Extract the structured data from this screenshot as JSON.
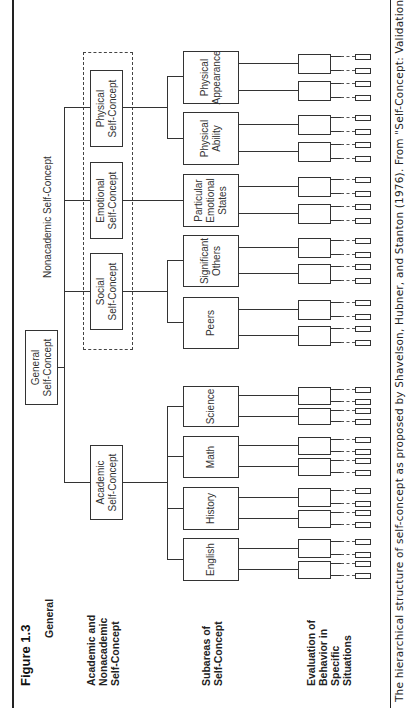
{
  "figure": {
    "title": "Figure 1.3",
    "caption": "The hierarchical structure of self-concept as proposed by Shavelson, Hubner, and Stanton (1976). From \"Self-Concept: Validation of Construct Interpretations\""
  },
  "level_labels": {
    "general": "General",
    "academic_nonacademic": [
      "Academic and",
      "Nonacademic",
      "Self-Concept"
    ],
    "subareas": [
      "Subareas of",
      "Self-Concept"
    ],
    "evaluation": [
      "Evaluation of",
      "Behavior in",
      "Specific",
      "Situations"
    ]
  },
  "nodes": {
    "general": [
      "General",
      "Self-Concept"
    ],
    "academic": [
      "Academic",
      "Self-Concept"
    ],
    "nonacademic_label": "Nonacademic Self-Concept",
    "social": [
      "Social",
      "Self-Concept"
    ],
    "emotional": [
      "Emotional",
      "Self-Concept"
    ],
    "physical": [
      "Physical",
      "Self-Concept"
    ]
  },
  "subareas": [
    {
      "label": "English"
    },
    {
      "label": "History"
    },
    {
      "label": "Math"
    },
    {
      "label": "Science"
    },
    {
      "label": "Peers"
    },
    {
      "label": "Significant Others"
    },
    {
      "label": "Particular Emotional States"
    },
    {
      "label": "Physical Ability"
    },
    {
      "label": "Physical Appearance"
    }
  ]
}
